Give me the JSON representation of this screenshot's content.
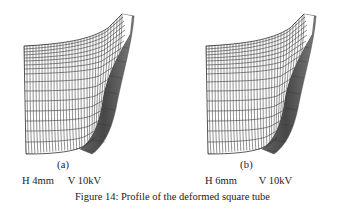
{
  "figure": {
    "caption": "Figure 14: Profile of the deformed square tube",
    "number": "Figure 14",
    "background_color": "#ffffff",
    "line_color": "#2b2b2b",
    "shade_color": "#4a4a4a"
  },
  "panels": [
    {
      "id": "a",
      "sub_label": "(a)",
      "params": {
        "h_label": "H 4mm",
        "v_label": "V 10kV"
      },
      "mesh": {
        "type": "deformed-square-tube-profile",
        "columns": 34,
        "rows": 17,
        "dense_top_rows": 8
      }
    },
    {
      "id": "b",
      "sub_label": "(b)",
      "params": {
        "h_label": "H 6mm",
        "v_label": "V 10kV"
      },
      "mesh": {
        "type": "deformed-square-tube-profile",
        "columns": 34,
        "rows": 17,
        "dense_top_rows": 8
      }
    }
  ]
}
